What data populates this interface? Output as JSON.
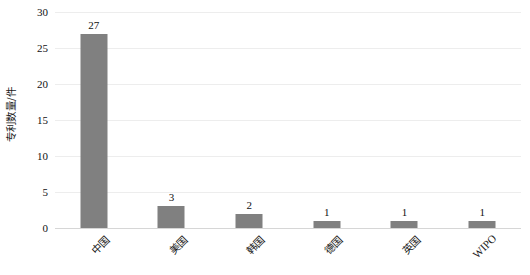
{
  "chart_data": {
    "type": "bar",
    "title": "",
    "subtitle": "",
    "xlabel": "",
    "ylabel": "专利数量/件",
    "categories": [
      "中国",
      "美国",
      "韩国",
      "德国",
      "英国",
      "WIPO"
    ],
    "values": [
      27,
      3,
      2,
      1,
      1,
      1
    ],
    "data_labels": [
      "27",
      "3",
      "2",
      "1",
      "1",
      "1"
    ],
    "ylim": [
      0,
      30
    ],
    "ytick_values": [
      0,
      5,
      10,
      15,
      20,
      25,
      30
    ],
    "ytick_labels": [
      "0",
      "5",
      "10",
      "15",
      "20",
      "25",
      "30"
    ],
    "grid": "horizontal",
    "legend": "none",
    "bar_color": "#808080",
    "gridline_color": "#ededed",
    "baseline_color": "#d6d6d6",
    "text_color": "#111111",
    "background_color": "#ffffff",
    "xtick_label_rotation": -45
  }
}
